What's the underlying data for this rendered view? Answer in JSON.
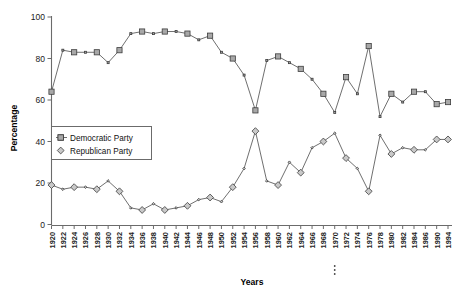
{
  "chart_data": {
    "type": "line",
    "title": "",
    "xlabel": "Years",
    "ylabel": "Percentage",
    "ylim": [
      0,
      100
    ],
    "yticks": [
      0,
      20,
      40,
      60,
      80,
      100
    ],
    "grid": false,
    "legend_position": "middle-left",
    "categories": [
      "1920",
      "1922",
      "1924",
      "1926",
      "1928",
      "1930",
      "1932",
      "1934",
      "1936",
      "1938",
      "1940",
      "1942",
      "1944",
      "1946",
      "1948",
      "1950",
      "1952",
      "1954",
      "1956",
      "1958",
      "1960",
      "1962",
      "1964",
      "1966",
      "1968",
      "1970",
      "1972",
      "1974",
      "1976",
      "1978",
      "1980",
      "1982",
      "1984",
      "1986",
      "1990",
      "1994"
    ],
    "series": [
      {
        "name": "Democratic Party",
        "marker": "square",
        "values": [
          64,
          84,
          83,
          83,
          83,
          78,
          84,
          92,
          93,
          92,
          93,
          93,
          92,
          89,
          91,
          83,
          80,
          72,
          55,
          79,
          81,
          78,
          75,
          70,
          63,
          54,
          71,
          63,
          86,
          52,
          63,
          59,
          64,
          64,
          58,
          59
        ]
      },
      {
        "name": "Republican Party",
        "marker": "diamond",
        "values": [
          19,
          17,
          18,
          18,
          17,
          21,
          16,
          8,
          7,
          10,
          7,
          8,
          9,
          12,
          13,
          11,
          18,
          27,
          45,
          21,
          19,
          30,
          25,
          37,
          40,
          44,
          32,
          27,
          16,
          43,
          34,
          37,
          36,
          36,
          41,
          41
        ]
      }
    ]
  },
  "axes": {
    "y_title": "Percentage",
    "x_title": "Years"
  },
  "legend": {
    "items": [
      {
        "label": "Democratic Party",
        "marker": "square-marker-icon"
      },
      {
        "label": "Republican Party",
        "marker": "diamond-marker-icon"
      }
    ]
  },
  "annotations": {
    "x_gap_ellipsis": "⋮"
  }
}
